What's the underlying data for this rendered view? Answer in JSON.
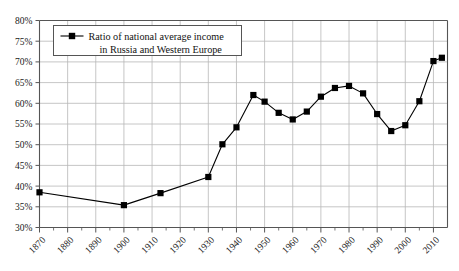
{
  "chart_data": {
    "type": "line",
    "title": "",
    "subtitle": "",
    "xlabel": "",
    "ylabel": "",
    "xlim": [
      1870,
      2015
    ],
    "ylim": [
      30,
      80
    ],
    "grid": true,
    "legend_position": "top-left",
    "legend": [
      "Ratio of national average income in Russia and Western Europe"
    ],
    "series": [
      {
        "name": "Ratio of national average income in Russia and Western Europe",
        "color": "#000000",
        "marker": "square",
        "x": [
          1870,
          1900,
          1913,
          1930,
          1935,
          1940,
          1946,
          1950,
          1955,
          1960,
          1965,
          1970,
          1975,
          1980,
          1985,
          1990,
          1995,
          2000,
          2005,
          2010,
          2013
        ],
        "values": [
          38.5,
          35.4,
          38.3,
          42.2,
          50.1,
          54.2,
          62.0,
          60.4,
          57.7,
          56.1,
          58.0,
          61.6,
          63.7,
          64.2,
          62.4,
          57.4,
          53.3,
          54.7,
          60.5,
          70.2,
          71.0
        ]
      }
    ],
    "y_ticks": [
      30,
      35,
      40,
      45,
      50,
      55,
      60,
      65,
      70,
      75,
      80
    ],
    "y_tick_labels": [
      "30%",
      "35%",
      "40%",
      "45%",
      "50%",
      "55%",
      "60%",
      "65%",
      "70%",
      "75%",
      "80%"
    ],
    "x_ticks": [
      1870,
      1880,
      1890,
      1900,
      1910,
      1920,
      1930,
      1940,
      1950,
      1960,
      1970,
      1980,
      1990,
      2000,
      2010
    ],
    "x_tick_labels": [
      "1870",
      "1880",
      "1890",
      "1900",
      "1910",
      "1920",
      "1930",
      "1940",
      "1950",
      "1960",
      "1970",
      "1980",
      "1990",
      "2000",
      "2010"
    ],
    "x_minor_ticks": [
      1875,
      1885,
      1895,
      1905,
      1915,
      1925,
      1935,
      1945,
      1955,
      1965,
      1975,
      1985,
      1995,
      2005
    ],
    "colors": {
      "line": "#1a1a1a",
      "marker": "#000000",
      "grid": "#b8b8b8",
      "axis": "#555555",
      "background": "#ffffff",
      "legend_border": "#555555"
    }
  }
}
